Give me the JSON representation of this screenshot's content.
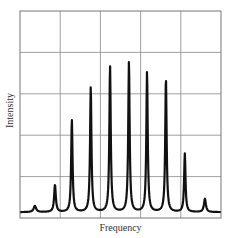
{
  "chart_data": {
    "type": "line",
    "title": "",
    "xlabel": "Frequency",
    "ylabel": "Intensity",
    "grid": true,
    "grid_columns": 5,
    "grid_rows": 5,
    "ylim": [
      0,
      5
    ],
    "xlim": [
      0,
      5
    ],
    "baseline": 0.14,
    "peaks": [
      {
        "x": 0.37,
        "y": 0.29,
        "width": 0.09
      },
      {
        "x": 0.87,
        "y": 0.8,
        "width": 0.06
      },
      {
        "x": 1.29,
        "y": 2.37,
        "width": 0.05
      },
      {
        "x": 1.76,
        "y": 3.16,
        "width": 0.05
      },
      {
        "x": 2.24,
        "y": 3.67,
        "width": 0.05
      },
      {
        "x": 2.71,
        "y": 3.77,
        "width": 0.05
      },
      {
        "x": 3.16,
        "y": 3.53,
        "width": 0.05
      },
      {
        "x": 3.63,
        "y": 3.38,
        "width": 0.05
      },
      {
        "x": 4.1,
        "y": 1.55,
        "width": 0.05
      },
      {
        "x": 4.6,
        "y": 0.46,
        "width": 0.07
      }
    ],
    "line_color": "#111111",
    "grid_color": "#888888"
  }
}
